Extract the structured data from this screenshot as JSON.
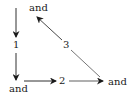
{
  "diagram": {
    "type": "directed-graph",
    "nodes": {
      "top": {
        "label": "and"
      },
      "bottom_left": {
        "label": "and"
      },
      "bottom_right": {
        "label": "and"
      }
    },
    "edges": [
      {
        "from": "top",
        "to": "bottom_left",
        "label": "1",
        "direction": "down"
      },
      {
        "from": "bottom_left",
        "to": "bottom_right",
        "label": "2",
        "direction": "right"
      },
      {
        "from": "bottom_right",
        "to": "top",
        "label": "3",
        "direction": "up-left"
      }
    ],
    "colors": {
      "stroke": "#1a1a1a",
      "background": "#ffffff"
    }
  }
}
